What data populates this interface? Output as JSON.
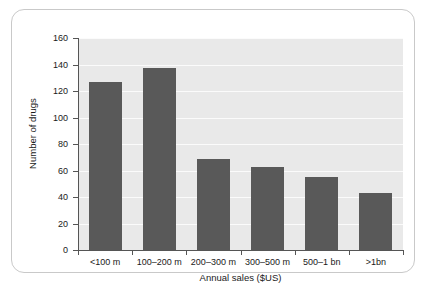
{
  "chart_data": {
    "type": "bar",
    "title": "",
    "subtitle": "",
    "categories": [
      "<100 m",
      "100–200 m",
      "200–300 m",
      "300–500 m",
      "500–1 bn",
      ">1bn"
    ],
    "values": [
      127,
      137,
      69,
      63,
      55,
      43
    ],
    "xlabel": "Annual sales ($US)",
    "ylabel": "Number of drugs",
    "ylim": [
      0,
      160
    ],
    "yticks": [
      0,
      20,
      40,
      60,
      80,
      100,
      120,
      140,
      160
    ],
    "ytick_labels": [
      "0",
      "20",
      "40",
      "60",
      "80",
      "100",
      "120",
      "140",
      "160"
    ],
    "grid": "horizontal",
    "legend": "none",
    "annotations": [],
    "colors": {
      "bar": "#595959",
      "plot_background": "#e9e9e9",
      "gridline": "#fbfbfb",
      "axis": "#555555",
      "frame_border": "#c9c9c9",
      "page_background": "#ffffff",
      "text": "#1a1a1a"
    }
  }
}
